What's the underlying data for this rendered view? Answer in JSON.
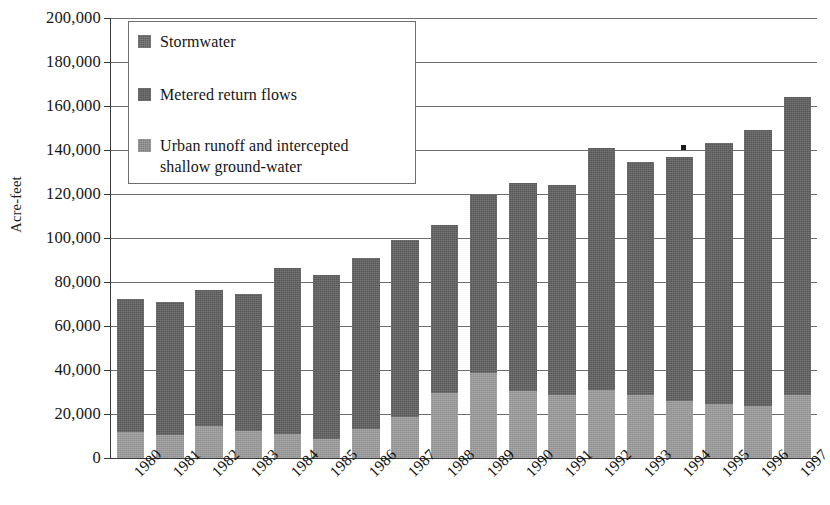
{
  "chart_data": {
    "type": "bar",
    "subtype": "stacked-vertical",
    "title": "",
    "xlabel": "",
    "ylabel": "Acre-feet",
    "ylim": [
      0,
      200000
    ],
    "ytick_step": 20000,
    "ytick_labels": [
      "0",
      "20,000",
      "40,000",
      "60,000",
      "80,000",
      "100,000",
      "120,000",
      "140,000",
      "160,000",
      "180,000",
      "200,000"
    ],
    "ytick_values": [
      0,
      20000,
      40000,
      60000,
      80000,
      100000,
      120000,
      140000,
      160000,
      180000,
      200000
    ],
    "grid": true,
    "grid_axis": "y",
    "legend_position": "top-left-inside",
    "categories": [
      "1980",
      "1981",
      "1982",
      "1983",
      "1984",
      "1985",
      "1986",
      "1987",
      "1988",
      "1989",
      "1990",
      "1991",
      "1992",
      "1993",
      "1994",
      "1995",
      "1996",
      "1997"
    ],
    "series": [
      {
        "name": "Urban runoff and intercepted shallow ground-water",
        "color": "#909090",
        "values": [
          12000,
          10500,
          14500,
          12500,
          11000,
          8500,
          13000,
          18500,
          29500,
          38500,
          30500,
          28500,
          31000,
          28500,
          26000,
          24500,
          23500,
          28500
        ]
      },
      {
        "name": "Metered return flows",
        "color": "#575757",
        "values": [
          60500,
          60500,
          62000,
          62000,
          75500,
          74500,
          78000,
          80500,
          76500,
          81500,
          94500,
          95500,
          100000,
          106000,
          111000,
          118500,
          125500,
          126500
        ]
      },
      {
        "name": "Stormwater",
        "color": "#585858",
        "values": [
          0,
          0,
          0,
          0,
          0,
          0,
          0,
          0,
          0,
          0,
          0,
          0,
          10000,
          0,
          0,
          0,
          0,
          9000
        ]
      }
    ],
    "totals": [
      72500,
      71000,
      76500,
      74500,
      86500,
      83000,
      91000,
      99000,
      106000,
      120000,
      125000,
      124000,
      141000,
      134500,
      137000,
      143000,
      149000,
      164000
    ],
    "annotations": [
      {
        "name": "stray-tick-above-1994",
        "x_category": "1994",
        "value": 140000
      }
    ]
  },
  "legend": {
    "entries": [
      {
        "label": "Stormwater",
        "swatch": "storm"
      },
      {
        "label": "Metered return flows",
        "swatch": "metered"
      },
      {
        "label": "Urban runoff and intercepted shallow ground-water",
        "swatch": "urban"
      }
    ],
    "entry0_label": "Stormwater",
    "entry1_label": "Metered return flows",
    "entry2_line1": "Urban runoff and intercepted",
    "entry2_line2": "shallow ground-water"
  },
  "axes": {
    "y_title": "Acre-feet"
  },
  "colors": {
    "stormwater": "#585858",
    "metered_return_flows": "#575757",
    "urban_runoff": "#909090",
    "axis": "#3a3a3a",
    "gridline": "#6d6d6d",
    "background": "#ffffff"
  }
}
